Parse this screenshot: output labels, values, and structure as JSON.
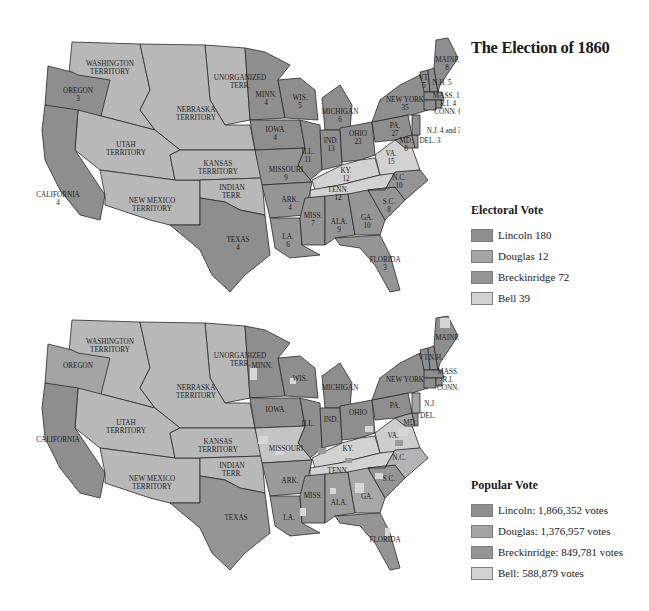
{
  "title": "The Election of 1860",
  "colors": {
    "lincoln": "#8e8e8e",
    "douglas": "#a4a4a4",
    "breckinridge": "#959595",
    "bell": "#d2d2d2",
    "territory": "#b8b8b8",
    "border": "#2a2a2a"
  },
  "electoral_legend": {
    "title": "Electoral Vote",
    "items": [
      {
        "label": "Lincoln 180",
        "color": "#8e8e8e"
      },
      {
        "label": "Douglas 12",
        "color": "#a4a4a4"
      },
      {
        "label": "Breckinridge 72",
        "color": "#959595"
      },
      {
        "label": "Bell 39",
        "color": "#d2d2d2"
      }
    ]
  },
  "popular_legend": {
    "title": "Popular Vote",
    "items": [
      {
        "label": "Lincoln: 1,866,352 votes",
        "color": "#8e8e8e"
      },
      {
        "label": "Douglas: 1,376,957 votes",
        "color": "#a4a4a4"
      },
      {
        "label": "Breckinridge: 849,781 votes",
        "color": "#959595"
      },
      {
        "label": "Bell: 588,879 votes",
        "color": "#d2d2d2"
      }
    ]
  },
  "electoral_map": {
    "labels": [
      {
        "name": "WASHINGTON",
        "sub": "TERRITORY"
      },
      {
        "name": "OREGON",
        "sub": "3"
      },
      {
        "name": "UNORGANIZED",
        "sub": "TERR."
      },
      {
        "name": "NEBRASKA",
        "sub": "TERRITORY"
      },
      {
        "name": "UTAH",
        "sub": "TERRITORY"
      },
      {
        "name": "CALIFORNIA",
        "sub": "4"
      },
      {
        "name": "KANSAS",
        "sub": "TERRITORY"
      },
      {
        "name": "NEW MEXICO",
        "sub": "TERRITORY"
      },
      {
        "name": "INDIAN",
        "sub": "TERR."
      },
      {
        "name": "TEXAS",
        "sub": "4"
      },
      {
        "name": "MINN.",
        "sub": "4"
      },
      {
        "name": "WIS.",
        "sub": "5"
      },
      {
        "name": "IOWA",
        "sub": "4"
      },
      {
        "name": "MICHIGAN",
        "sub": "6"
      },
      {
        "name": "ILL.",
        "sub": "11"
      },
      {
        "name": "IND.",
        "sub": "13"
      },
      {
        "name": "OHIO",
        "sub": "23"
      },
      {
        "name": "MISSOURI",
        "sub": "9"
      },
      {
        "name": "KY.",
        "sub": "12"
      },
      {
        "name": "TENN.",
        "sub": "12"
      },
      {
        "name": "ARK.",
        "sub": "4"
      },
      {
        "name": "LA.",
        "sub": "6"
      },
      {
        "name": "MISS.",
        "sub": "7"
      },
      {
        "name": "ALA.",
        "sub": "9"
      },
      {
        "name": "GA.",
        "sub": "10"
      },
      {
        "name": "S.C.",
        "sub": "8"
      },
      {
        "name": "N.C.",
        "sub": "10"
      },
      {
        "name": "VA.",
        "sub": "15"
      },
      {
        "name": "FLORIDA",
        "sub": "3"
      },
      {
        "name": "PA.",
        "sub": "27"
      },
      {
        "name": "NEW YORK",
        "sub": "35"
      },
      {
        "name": "MAINE",
        "sub": "8"
      },
      {
        "name": "VT.",
        "sub": "5"
      },
      {
        "name": "N.H. 5",
        "sub": ""
      },
      {
        "name": "MASS. 13",
        "sub": ""
      },
      {
        "name": "R.I. 4",
        "sub": ""
      },
      {
        "name": "CONN. 6",
        "sub": ""
      },
      {
        "name": "N.J. 4 and 3",
        "sub": ""
      },
      {
        "name": "MD.",
        "sub": "8"
      },
      {
        "name": "DEL. 3",
        "sub": ""
      }
    ]
  },
  "popular_map": {
    "labels": [
      {
        "name": "WASHINGTON",
        "sub": "TERRITORY"
      },
      {
        "name": "OREGON",
        "sub": ""
      },
      {
        "name": "UNORGANIZED",
        "sub": "TERR."
      },
      {
        "name": "NEBRASKA",
        "sub": "TERRITORY"
      },
      {
        "name": "UTAH",
        "sub": "TERRITORY"
      },
      {
        "name": "CALIFORNIA",
        "sub": ""
      },
      {
        "name": "KANSAS",
        "sub": "TERRITORY"
      },
      {
        "name": "NEW MEXICO",
        "sub": "TERRITORY"
      },
      {
        "name": "INDIAN",
        "sub": "TERR."
      },
      {
        "name": "TEXAS",
        "sub": ""
      },
      {
        "name": "MINN.",
        "sub": ""
      },
      {
        "name": "WIS.",
        "sub": ""
      },
      {
        "name": "IOWA",
        "sub": ""
      },
      {
        "name": "MICHIGAN",
        "sub": ""
      },
      {
        "name": "ILL.",
        "sub": ""
      },
      {
        "name": "IND.",
        "sub": ""
      },
      {
        "name": "OHIO",
        "sub": ""
      },
      {
        "name": "MISSOURI",
        "sub": ""
      },
      {
        "name": "KY.",
        "sub": ""
      },
      {
        "name": "TENN.",
        "sub": ""
      },
      {
        "name": "ARK.",
        "sub": ""
      },
      {
        "name": "LA.",
        "sub": ""
      },
      {
        "name": "MISS.",
        "sub": ""
      },
      {
        "name": "ALA.",
        "sub": ""
      },
      {
        "name": "GA.",
        "sub": ""
      },
      {
        "name": "S.C.",
        "sub": ""
      },
      {
        "name": "N.C.",
        "sub": ""
      },
      {
        "name": "VA.",
        "sub": ""
      },
      {
        "name": "FLORIDA",
        "sub": ""
      },
      {
        "name": "PA.",
        "sub": ""
      },
      {
        "name": "NEW YORK",
        "sub": ""
      },
      {
        "name": "MAINE",
        "sub": ""
      },
      {
        "name": "VT.",
        "sub": ""
      },
      {
        "name": "N.H.",
        "sub": ""
      },
      {
        "name": "MASS.",
        "sub": ""
      },
      {
        "name": "R.I.",
        "sub": ""
      },
      {
        "name": "CONN.",
        "sub": ""
      },
      {
        "name": "N.J.",
        "sub": ""
      },
      {
        "name": "MD.",
        "sub": ""
      },
      {
        "name": "DEL.",
        "sub": ""
      }
    ]
  }
}
